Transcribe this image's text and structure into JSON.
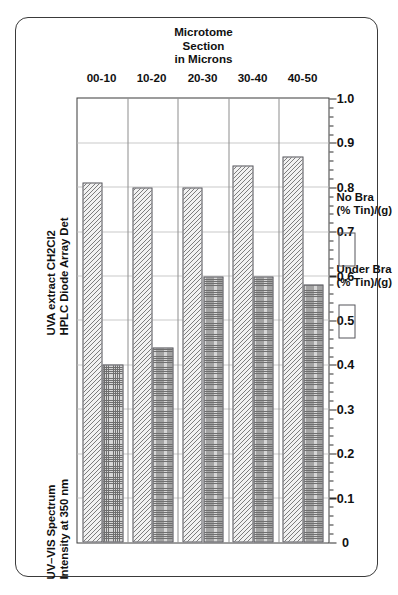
{
  "figure": {
    "caption_left": "UV–VIS Spectrum\nIntensity at 350 nm",
    "caption_right": "UVA extract CH2Cl2\nHPLC Diode Array Det"
  },
  "legend": {
    "items": [
      {
        "label": "Under Bra\n(% Tin)/(g)",
        "swatch": "hatched-swatch"
      },
      {
        "label": "No Bra\n(% Tin)/(g)",
        "swatch": "dotted-swatch"
      }
    ]
  },
  "chart_data": {
    "type": "bar",
    "orientation": "horizontal",
    "categories": [
      "00-10",
      "10-20",
      "20-30",
      "30-40",
      "40-50"
    ],
    "category_axis_label": "Microtome Section\nin Microns",
    "value_axis_label": "",
    "value_ticks": [
      "1.0",
      "0.9",
      "0.8",
      "0.7",
      "0.6",
      "0.5",
      "0.4",
      "0.3",
      "0.2",
      "0.1",
      "0"
    ],
    "value_tick_values": [
      1.0,
      0.9,
      0.8,
      0.7,
      0.6,
      0.5,
      0.4,
      0.3,
      0.2,
      0.1,
      0
    ],
    "xlim": [
      0,
      1.0
    ],
    "grid": true,
    "legend_position": "top-right",
    "series": [
      {
        "name": "Under Bra (% Tin)/(g)",
        "pattern": "hatched",
        "values": [
          0.81,
          0.8,
          0.8,
          0.85,
          0.87
        ]
      },
      {
        "name": "No Bra (% Tin)/(g)",
        "pattern": "dotted",
        "values": [
          0.4,
          0.44,
          0.6,
          0.6,
          0.58
        ]
      }
    ]
  }
}
